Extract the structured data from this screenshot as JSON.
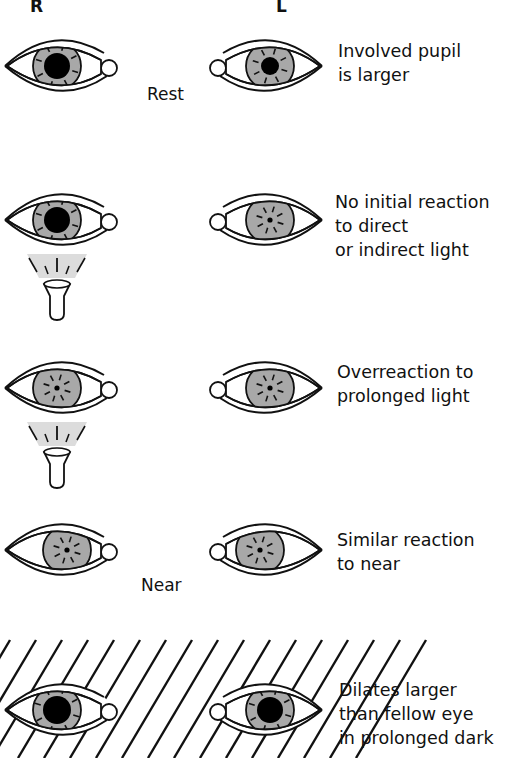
{
  "columns": {
    "right": "R",
    "left": "L"
  },
  "iris_color": "#a8a8a8",
  "light_color": "#dcdcdc",
  "rows": [
    {
      "id": "rest",
      "condition": "Rest",
      "description": "Involved pupil\nis larger",
      "right_pupil": "large",
      "left_pupil": "medium",
      "light_source": false,
      "dark": false
    },
    {
      "id": "initial-light",
      "condition": "",
      "description": "No initial reaction\nto direct\nor indirect light",
      "right_pupil": "large",
      "left_pupil": "small",
      "light_source": true,
      "dark": false
    },
    {
      "id": "prolonged-light",
      "condition": "",
      "description": "Overreaction to\nprolonged light",
      "right_pupil": "small",
      "left_pupil": "small",
      "light_source": true,
      "dark": false
    },
    {
      "id": "near",
      "condition": "Near",
      "description": "Similar reaction\nto near",
      "right_pupil": "small",
      "left_pupil": "small",
      "light_source": false,
      "dark": false
    },
    {
      "id": "prolonged-dark",
      "condition": "",
      "description": "Dilates larger\nthan fellow eye\nin prolonged dark",
      "right_pupil": "xlarge",
      "left_pupil": "large",
      "light_source": false,
      "dark": true
    }
  ]
}
